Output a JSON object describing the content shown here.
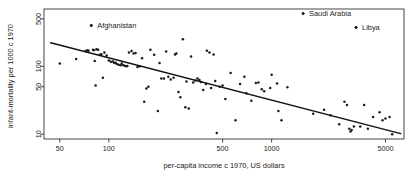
{
  "chart_data": {
    "type": "scatter",
    "title": "",
    "xlabel": "per-capita income c 1970, US dollars",
    "ylabel": "infant-mortality per 1000 c 1970",
    "xscale": "log",
    "yscale": "log",
    "xlim": [
      40,
      6500
    ],
    "ylim": [
      8.5,
      700
    ],
    "grid": false,
    "legend": "none",
    "xticks": [
      50,
      100,
      500,
      1000,
      5000
    ],
    "xtick_labels": [
      "50",
      "100",
      "500",
      "1000",
      "5000"
    ],
    "yticks": [
      10,
      50,
      100,
      500
    ],
    "ytick_labels": [
      "10",
      "50",
      "100",
      "500"
    ],
    "point_color": "#1a1a1a",
    "line_color": "#111111",
    "regression_line": {
      "x": [
        44,
        6200
      ],
      "y": [
        222,
        10.2
      ]
    },
    "annotations": [
      {
        "label": "Afghanistan",
        "x": 78,
        "y": 400,
        "label_dx": 6,
        "label_dy": 2.6
      },
      {
        "label": "Saudi Arabia",
        "x": 1560,
        "y": 600,
        "label_dx": 6,
        "label_dy": 2.6
      },
      {
        "label": "Libya",
        "x": 3300,
        "y": 375,
        "label_dx": 6,
        "label_dy": 2.6
      }
    ],
    "points": [
      [
        50,
        110
      ],
      [
        63,
        128
      ],
      [
        72,
        168
      ],
      [
        74,
        172
      ],
      [
        75,
        170
      ],
      [
        78,
        400
      ],
      [
        80,
        175
      ],
      [
        81,
        173
      ],
      [
        82,
        120
      ],
      [
        83,
        52
      ],
      [
        84,
        178
      ],
      [
        86,
        176
      ],
      [
        88,
        148
      ],
      [
        90,
        151
      ],
      [
        92,
        68
      ],
      [
        94,
        160
      ],
      [
        97,
        145
      ],
      [
        100,
        122
      ],
      [
        103,
        117
      ],
      [
        106,
        118
      ],
      [
        108,
        112
      ],
      [
        110,
        113
      ],
      [
        112,
        108
      ],
      [
        115,
        106
      ],
      [
        118,
        104
      ],
      [
        120,
        110
      ],
      [
        122,
        105
      ],
      [
        125,
        102
      ],
      [
        128,
        100
      ],
      [
        130,
        101
      ],
      [
        133,
        160
      ],
      [
        138,
        168
      ],
      [
        142,
        155
      ],
      [
        146,
        157
      ],
      [
        150,
        98
      ],
      [
        155,
        100
      ],
      [
        160,
        132
      ],
      [
        165,
        30
      ],
      [
        170,
        47
      ],
      [
        175,
        50
      ],
      [
        180,
        175
      ],
      [
        190,
        148
      ],
      [
        200,
        22
      ],
      [
        205,
        112
      ],
      [
        210,
        66
      ],
      [
        218,
        66
      ],
      [
        225,
        165
      ],
      [
        232,
        70
      ],
      [
        240,
        64
      ],
      [
        250,
        68
      ],
      [
        255,
        150
      ],
      [
        260,
        155
      ],
      [
        268,
        42
      ],
      [
        275,
        35
      ],
      [
        285,
        250
      ],
      [
        295,
        25
      ],
      [
        300,
        60
      ],
      [
        310,
        24
      ],
      [
        320,
        140
      ],
      [
        330,
        58
      ],
      [
        340,
        62
      ],
      [
        350,
        66
      ],
      [
        360,
        63
      ],
      [
        368,
        59
      ],
      [
        380,
        45
      ],
      [
        395,
        55
      ],
      [
        400,
        170
      ],
      [
        415,
        160
      ],
      [
        425,
        48
      ],
      [
        440,
        150
      ],
      [
        450,
        61
      ],
      [
        460,
        10.4
      ],
      [
        480,
        50
      ],
      [
        500,
        52
      ],
      [
        520,
        33
      ],
      [
        560,
        80
      ],
      [
        600,
        16
      ],
      [
        640,
        55
      ],
      [
        680,
        70
      ],
      [
        700,
        40
      ],
      [
        750,
        31
      ],
      [
        800,
        57
      ],
      [
        830,
        58
      ],
      [
        870,
        46
      ],
      [
        900,
        43
      ],
      [
        980,
        48
      ],
      [
        1000,
        75
      ],
      [
        1080,
        56
      ],
      [
        1100,
        22
      ],
      [
        1150,
        16
      ],
      [
        1250,
        49
      ],
      [
        1560,
        600
      ],
      [
        1800,
        20
      ],
      [
        2100,
        23
      ],
      [
        2300,
        19
      ],
      [
        2600,
        14
      ],
      [
        2800,
        30
      ],
      [
        2900,
        27
      ],
      [
        3000,
        12
      ],
      [
        3050,
        11
      ],
      [
        3100,
        11.5
      ],
      [
        3200,
        13
      ],
      [
        3300,
        375
      ],
      [
        3500,
        13
      ],
      [
        3700,
        27
      ],
      [
        3900,
        12
      ],
      [
        4200,
        18
      ],
      [
        4600,
        21
      ],
      [
        4800,
        16
      ],
      [
        5000,
        17
      ],
      [
        5300,
        18
      ],
      [
        5500,
        10
      ]
    ]
  }
}
